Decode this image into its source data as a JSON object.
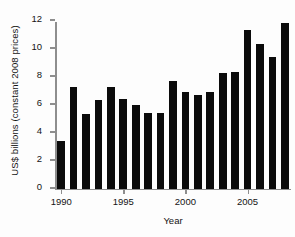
{
  "chart_data": {
    "type": "bar",
    "title": "",
    "xlabel": "Year",
    "ylabel": "US$ billions (constant 2008 prices)",
    "categories": [
      1990,
      1991,
      1992,
      1993,
      1994,
      1995,
      1996,
      1997,
      1998,
      1999,
      2000,
      2001,
      2002,
      2003,
      2004,
      2005,
      2006,
      2007,
      2008
    ],
    "values": [
      3.4,
      7.25,
      5.3,
      6.3,
      7.25,
      6.4,
      6.0,
      5.4,
      5.4,
      7.65,
      6.9,
      6.65,
      6.9,
      8.25,
      8.35,
      11.3,
      10.35,
      9.4,
      11.8
    ],
    "ylim": [
      0,
      12
    ],
    "ytick_labels": [
      "0",
      "2",
      "4",
      "6",
      "8",
      "10",
      "12"
    ],
    "ytick_values": [
      0,
      2,
      4,
      6,
      8,
      10,
      12
    ],
    "xtick_labels": [
      "1990",
      "1995",
      "2000",
      "2005"
    ],
    "xtick_values": [
      1990,
      1995,
      2000,
      2005
    ],
    "grid": false,
    "legend": false,
    "bar_color": "#0b0b0b",
    "axis_color": "#8e8e8e",
    "background": "#fdfdfd"
  }
}
